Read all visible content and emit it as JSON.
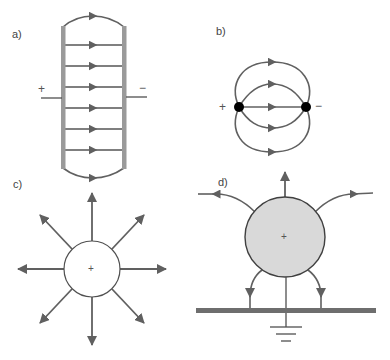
{
  "figure": {
    "colors": {
      "line": "#606060",
      "plate": "#9a9a9a",
      "charge_dot": "#000000",
      "sphere_fill_c": "#ffffff",
      "sphere_fill_d": "#d9d9d9",
      "ground_plane": "#6e6e6e",
      "label": "#444444"
    },
    "panels": [
      {
        "id": "a",
        "label": "a)",
        "title": "Parallel-plate capacitor field",
        "positive_sign": "+",
        "negative_sign": "−",
        "field_line_count": 8
      },
      {
        "id": "b",
        "label": "b)",
        "title": "Dipole field between two point charges",
        "positive_sign": "+",
        "negative_sign": "−",
        "field_line_count": 5
      },
      {
        "id": "c",
        "label": "c)",
        "title": "Radial field of an isolated positive sphere",
        "center_sign": "+",
        "field_line_count": 8
      },
      {
        "id": "d",
        "label": "d)",
        "title": "Charged sphere above a grounded plane",
        "center_sign": "+",
        "field_line_count": 5
      }
    ]
  }
}
